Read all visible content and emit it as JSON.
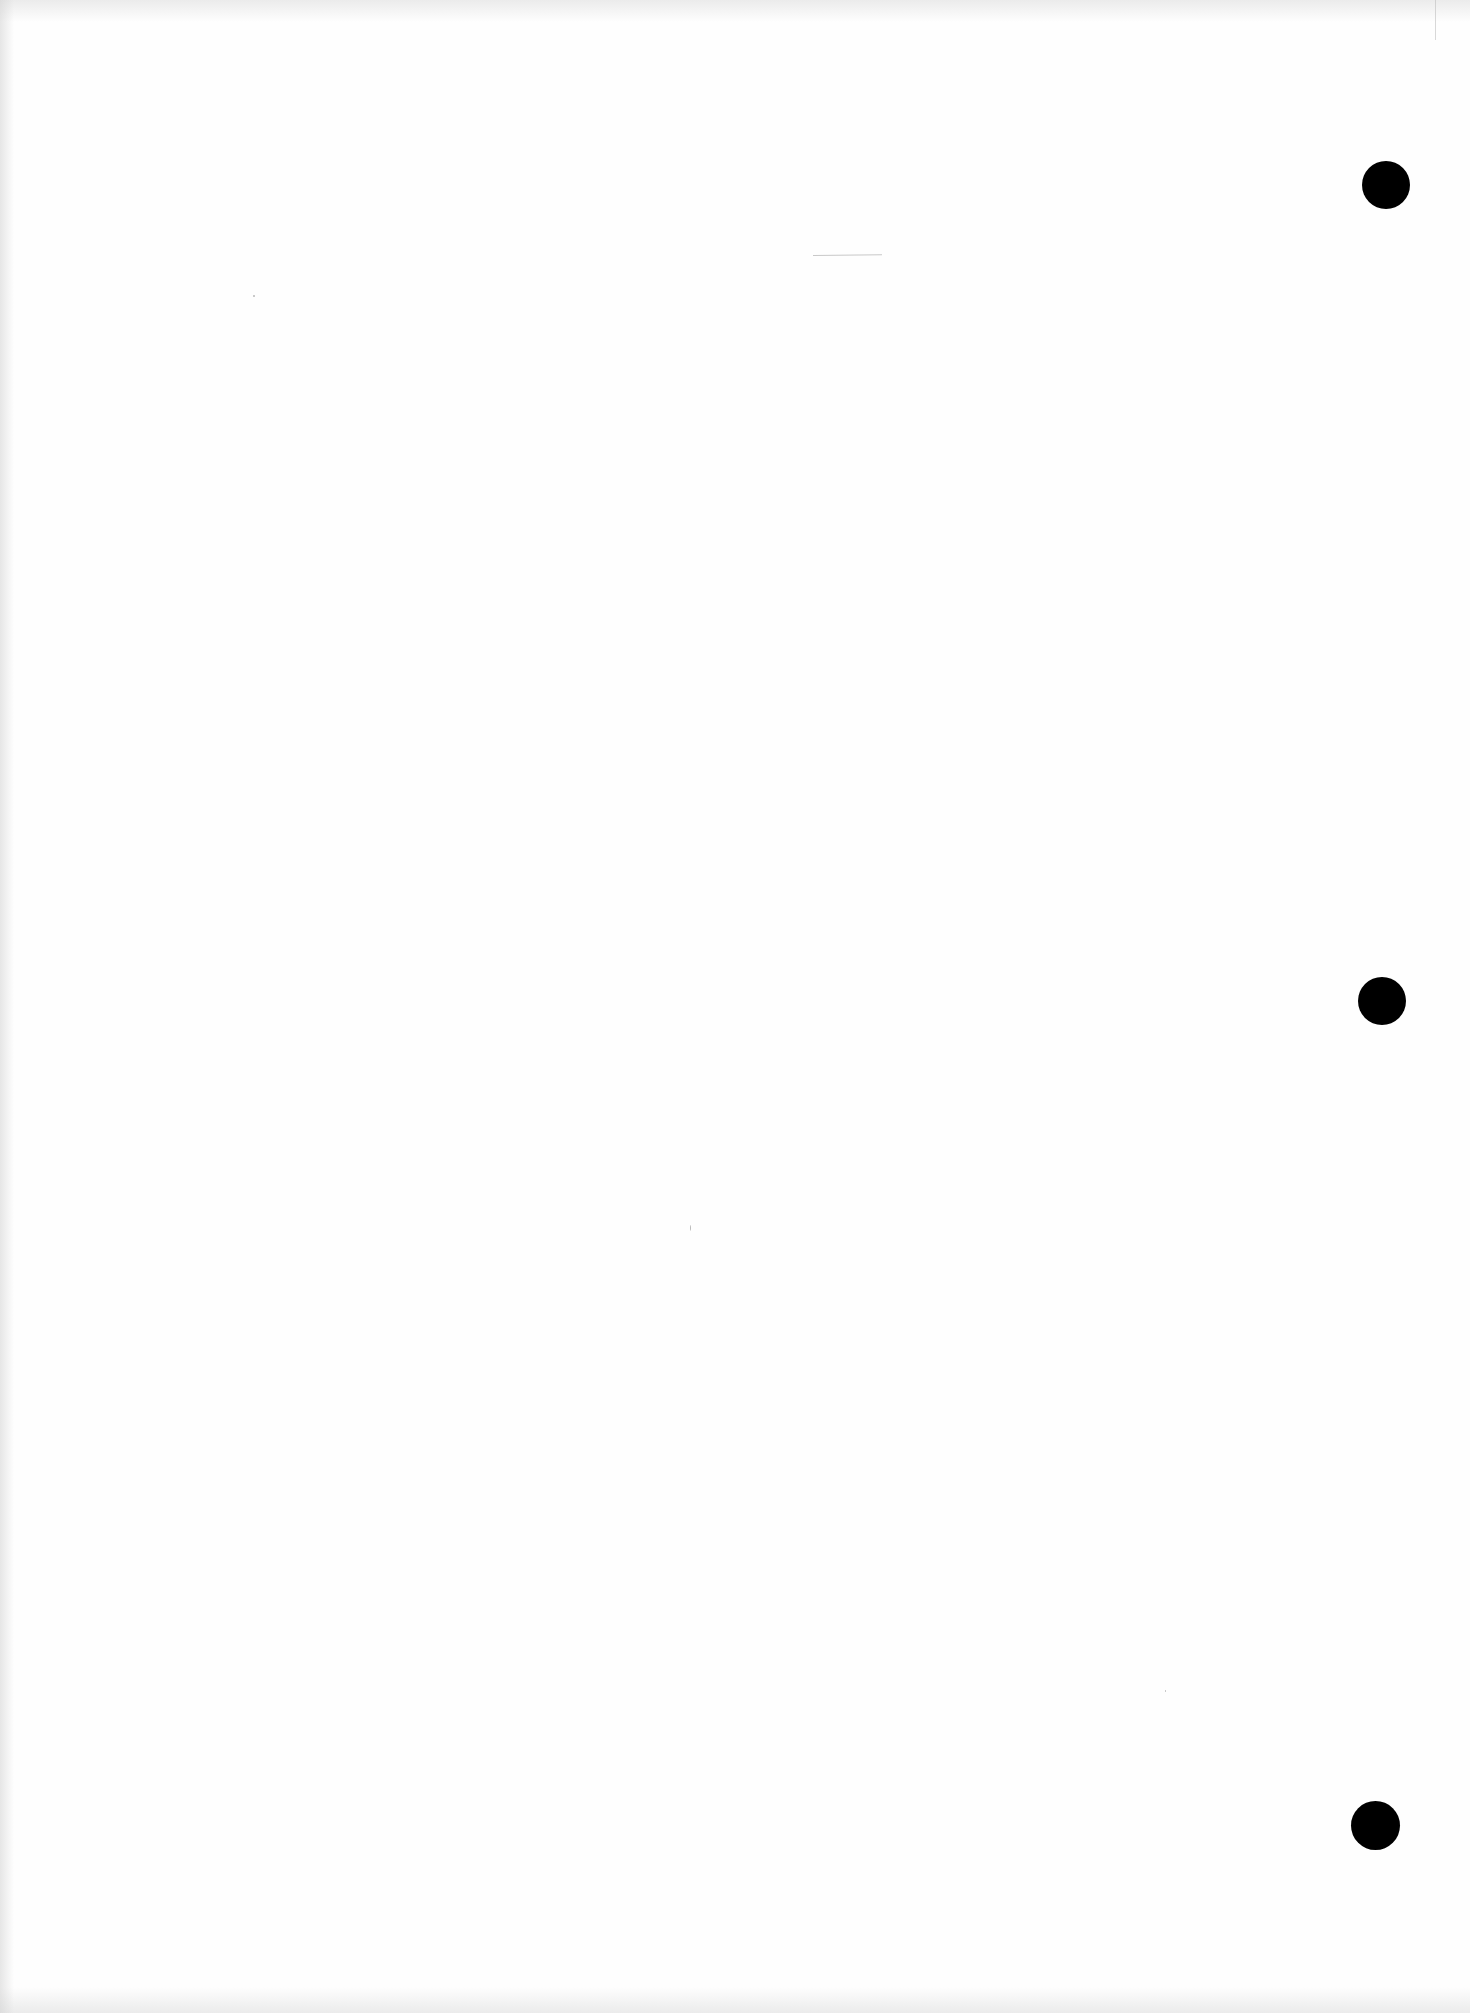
{
  "document": {
    "type": "blank scanned page",
    "text": "",
    "background_color": "#fefefe",
    "punch_holes": [
      {
        "cx": 1386,
        "cy": 185,
        "diameter": 48,
        "color": "#000000"
      },
      {
        "cx": 1382,
        "cy": 1001,
        "diameter": 48,
        "color": "#000000"
      },
      {
        "cx": 1375,
        "cy": 1825,
        "diameter": 49,
        "color": "#000000"
      }
    ],
    "marks": [
      {
        "kind": "faint-line",
        "x": 813,
        "y": 255,
        "width": 69,
        "color": "#c8c8c8"
      },
      {
        "kind": "speck",
        "x": 253,
        "y": 295
      },
      {
        "kind": "speck",
        "x": 690,
        "y": 1225
      },
      {
        "kind": "speck",
        "x": 1165,
        "y": 1690
      }
    ]
  }
}
